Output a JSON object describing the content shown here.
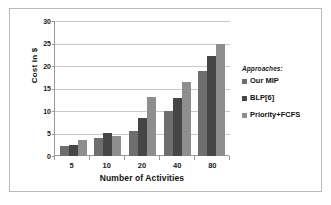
{
  "chart_data": {
    "type": "bar",
    "title": "",
    "xlabel": "Number of Activities",
    "ylabel": "Cost in $",
    "categories": [
      "5",
      "10",
      "20",
      "40",
      "80"
    ],
    "series": [
      {
        "name": "Our MIP",
        "color": "#6e6e6e",
        "values": [
          2.2,
          3.9,
          5.6,
          10.0,
          19.0
        ]
      },
      {
        "name": "BLP[6]",
        "color": "#464646",
        "values": [
          2.5,
          5.1,
          8.4,
          12.8,
          22.3
        ]
      },
      {
        "name": "Priority+FCFS",
        "color": "#8e8e8e",
        "values": [
          3.6,
          4.5,
          13.1,
          16.4,
          25.0
        ]
      }
    ],
    "ylim": [
      0,
      30
    ],
    "yticks": [
      0,
      5,
      10,
      15,
      20,
      25,
      30
    ],
    "ytick_labels": [
      "0",
      "5",
      "10",
      "15",
      "20",
      "25",
      "30"
    ],
    "grid": true,
    "legend_position": "right",
    "legend_title": "Approaches:"
  }
}
